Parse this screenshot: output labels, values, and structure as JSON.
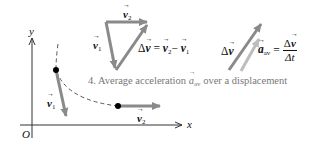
{
  "diagram": {
    "axes": {
      "x_label": "x",
      "y_label": "y",
      "origin_label": "O"
    },
    "path": {
      "point1_vector_label": "v",
      "point1_vector_sub": "1",
      "point2_vector_label": "v",
      "point2_vector_sub": "2"
    },
    "triangle": {
      "v1_label": "v",
      "v1_sub": "1",
      "v2_label": "v",
      "v2_sub": "2",
      "equation_delta": "Δ",
      "equation_v": "v",
      "equation_eq": "=",
      "equation_v2": "v",
      "equation_v2_sub": "2",
      "equation_minus": "−",
      "equation_v1": "v",
      "equation_v1_sub": "1"
    },
    "average_acceleration": {
      "delta_v_label_delta": "Δ",
      "delta_v_label_v": "v",
      "a_label": "a",
      "a_sub": "av",
      "eq": "=",
      "frac_num_delta": "Δ",
      "frac_num_v": "v",
      "frac_den": "Δt"
    },
    "caption": {
      "prefix": "4. Average acceleration",
      "symbol": "a",
      "symbol_sub": "av",
      "suffix": "over a displacement"
    },
    "colors": {
      "vector_dark": "#8a8a8a",
      "vector_light": "#bdbdbd",
      "axis": "#333333",
      "path_dashed": "#555555",
      "point": "#000000"
    }
  }
}
